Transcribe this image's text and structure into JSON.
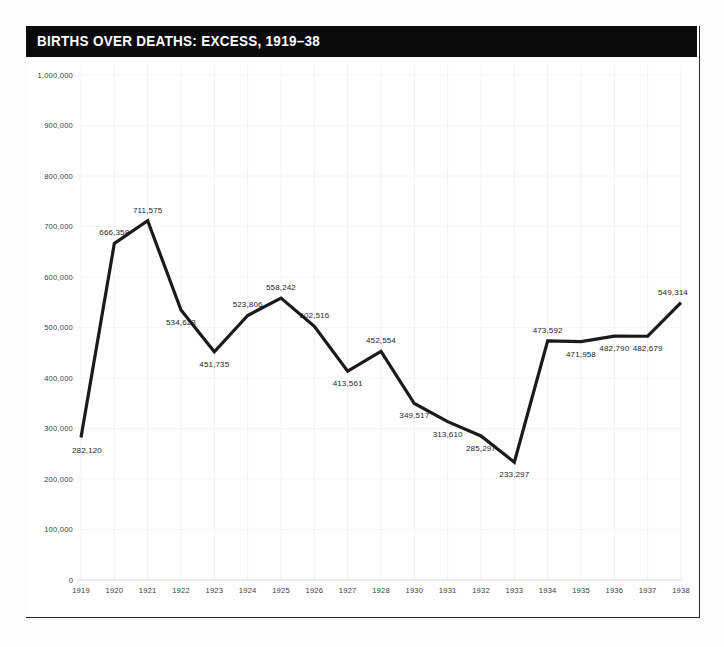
{
  "card": {
    "title": "BIRTHS OVER DEATHS: EXCESS, 1919–38"
  },
  "chart_data": {
    "type": "line",
    "title": "BIRTHS OVER DEATHS: EXCESS, 1919–38",
    "xlabel": "",
    "ylabel": "",
    "ylim": [
      0,
      1000000
    ],
    "grid": true,
    "legend": false,
    "y_ticks": [
      0,
      100000,
      200000,
      300000,
      400000,
      500000,
      600000,
      700000,
      800000,
      900000,
      1000000
    ],
    "y_tick_labels": [
      "0",
      "100,000",
      "200,000",
      "300,000",
      "400,000",
      "500,000",
      "600,000",
      "700,000",
      "800,000",
      "900,000",
      "1,000,000"
    ],
    "categories": [
      "1919",
      "1920",
      "1921",
      "1922",
      "1923",
      "1924",
      "1925",
      "1926",
      "1927",
      "1928",
      "1930",
      "1931",
      "1932",
      "1933",
      "1934",
      "1935",
      "1936",
      "1937",
      "1938"
    ],
    "values": [
      282120,
      666358,
      711575,
      534623,
      451735,
      523806,
      558242,
      502516,
      413561,
      452554,
      349517,
      313610,
      285297,
      233297,
      473592,
      471958,
      482790,
      482679,
      549314
    ],
    "point_labels": [
      "282,120",
      "666,358",
      "711,575",
      "534,623",
      "451,735",
      "523,806",
      "558,242",
      "502,516",
      "413,561",
      "452,554",
      "349,517",
      "313,610",
      "285,297",
      "233,297",
      "473,592",
      "471,958",
      "482,790",
      "482,679",
      "549,314"
    ],
    "label_positions": [
      "below",
      "above",
      "above",
      "below",
      "below",
      "above",
      "above",
      "above",
      "below",
      "above",
      "below",
      "below",
      "below",
      "below",
      "above",
      "below",
      "below",
      "below",
      "above"
    ],
    "line_color": "#1a1a1a",
    "background_color": "#ffffff",
    "title_bar_color": "#0b0b0b",
    "grid_color": "#f1f1f1"
  }
}
